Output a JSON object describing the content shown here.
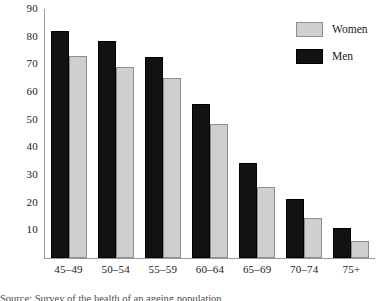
{
  "chart_data": {
    "type": "bar",
    "title": "",
    "xlabel": "",
    "ylabel": "",
    "categories": [
      "45–49",
      "50–54",
      "55–59",
      "60–64",
      "65–69",
      "70–74",
      "75+"
    ],
    "series": [
      {
        "name": "Men",
        "color": "#121212",
        "values": [
          82,
          78.5,
          72.5,
          55.5,
          34.5,
          21.5,
          11
        ]
      },
      {
        "name": "Women",
        "color": "#cfcfcf",
        "values": [
          73,
          69,
          65,
          48.5,
          25.5,
          14.5,
          6
        ]
      }
    ],
    "ylim": [
      0,
      90
    ],
    "yticks": [
      10,
      20,
      30,
      40,
      50,
      60,
      70,
      80,
      90
    ],
    "ytick_labels": [
      "10",
      "20",
      "30",
      "40",
      "50",
      "60",
      "70",
      "80",
      "90"
    ],
    "grid": false,
    "legend_position": "top-right",
    "legend_entries": [
      {
        "label": "Women",
        "color": "#cfcfcf"
      },
      {
        "label": "Men",
        "color": "#121212"
      }
    ]
  },
  "caption": {
    "text": "Source: Survey of the health of an ageing population"
  }
}
